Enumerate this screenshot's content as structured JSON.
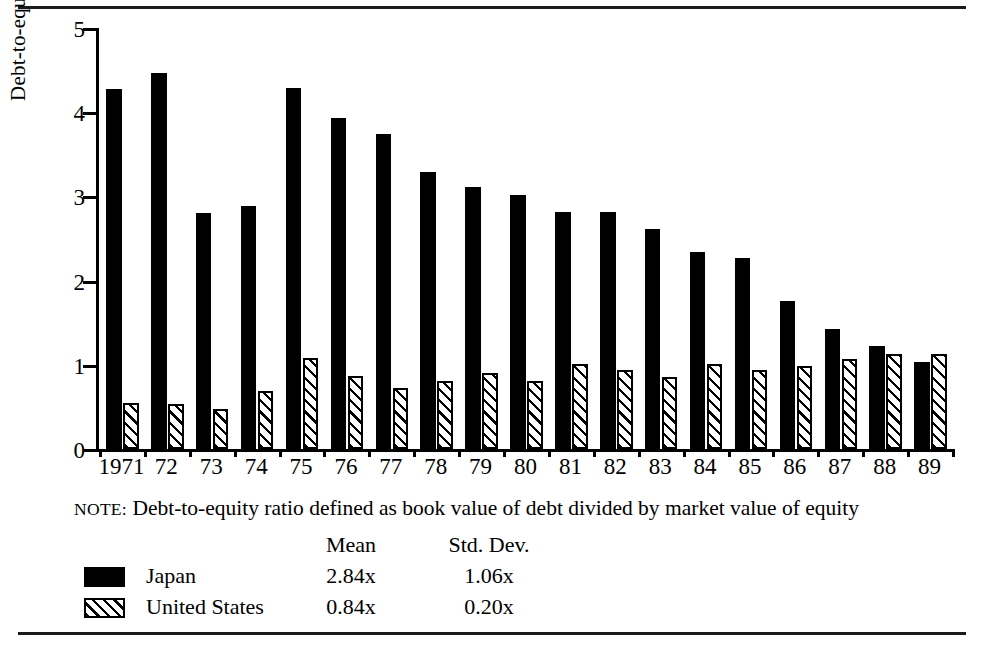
{
  "chart_data": {
    "type": "bar",
    "title": "",
    "xlabel": "",
    "ylabel": "Debt-to-equity ratio (x)",
    "ylim": [
      0,
      5
    ],
    "ytick_labels": [
      "0",
      "1",
      "2",
      "3",
      "4",
      "5"
    ],
    "yticks": [
      0,
      1,
      2,
      3,
      4,
      5
    ],
    "grid": false,
    "legend_position": "below-plot",
    "categories": [
      "1971",
      "72",
      "73",
      "74",
      "75",
      "76",
      "77",
      "78",
      "79",
      "80",
      "81",
      "82",
      "83",
      "84",
      "85",
      "86",
      "87",
      "88",
      "89"
    ],
    "series": [
      {
        "name": "Japan",
        "fill": "solid-black",
        "color": "#000000",
        "values": [
          4.27,
          4.47,
          2.8,
          2.89,
          4.29,
          3.93,
          3.74,
          3.29,
          3.11,
          3.02,
          2.82,
          2.82,
          2.61,
          2.34,
          2.27,
          1.76,
          1.43,
          1.22,
          1.03
        ],
        "mean": "2.84x",
        "std_dev": "1.06x"
      },
      {
        "name": "United States",
        "fill": "diagonal-hatch",
        "color": "#000000",
        "values": [
          0.55,
          0.53,
          0.47,
          0.69,
          1.08,
          0.87,
          0.72,
          0.81,
          0.9,
          0.81,
          1.01,
          0.94,
          0.85,
          1.01,
          0.94,
          0.98,
          1.07,
          1.13,
          1.13
        ],
        "mean": "0.84x",
        "std_dev": "0.20x"
      }
    ],
    "note": "Debt-to-equity ratio defined as book value of debt divided by market value of equity"
  },
  "note": {
    "prefix": "NOTE:",
    "text": "Debt-to-equity ratio defined as book value of debt divided by market value of equity"
  },
  "legend": {
    "header": {
      "blank": "",
      "mean": "Mean",
      "std_dev": "Std. Dev."
    },
    "rows": [
      {
        "name": "Japan",
        "mean": "2.84x",
        "std_dev": "1.06x"
      },
      {
        "name": "United States",
        "mean": "0.84x",
        "std_dev": "0.20x"
      }
    ]
  }
}
